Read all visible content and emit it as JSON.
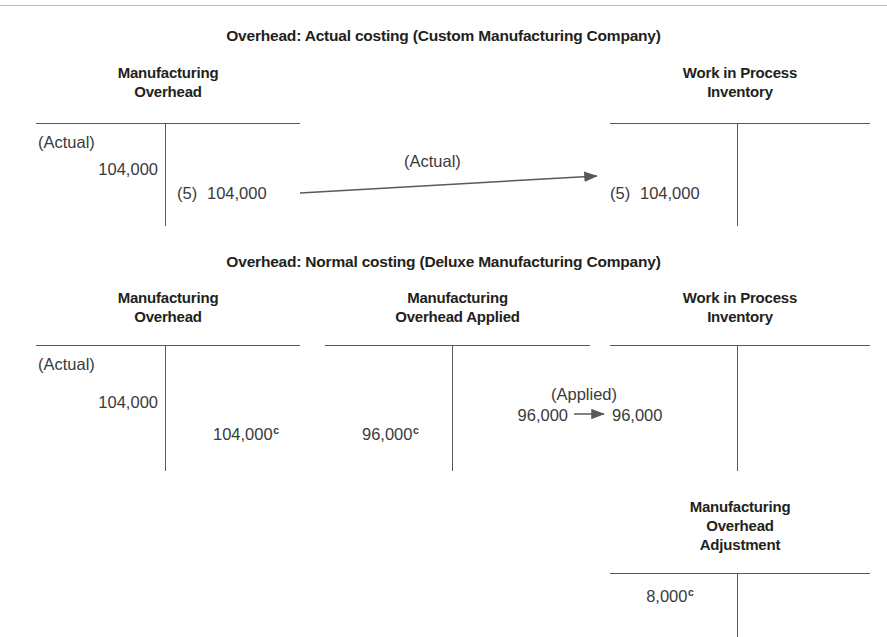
{
  "figure": {
    "note_marker": "c"
  },
  "sections": [
    {
      "title": "Overhead: Actual costing (Custom Manufacturing Company)",
      "accounts": [
        {
          "name": "Manufacturing Overhead",
          "line1": "Manufacturing",
          "line2": "Overhead",
          "debit_tag": "(Actual)",
          "debit_amount": "104,000",
          "credit_ref": "(5)",
          "credit_amount": "104,000"
        },
        {
          "name": "Work in Process Inventory",
          "line1": "Work in Process",
          "line2": "Inventory",
          "debit_ref": "(5)",
          "debit_amount": "104,000"
        }
      ],
      "flow": {
        "label": "(Actual)",
        "from_amount": "104,000",
        "to_amount": "104,000"
      }
    },
    {
      "title": "Overhead: Normal costing (Deluxe Manufacturing Company)",
      "accounts": [
        {
          "name": "Manufacturing Overhead",
          "line1": "Manufacturing",
          "line2": "Overhead",
          "debit_tag": "(Actual)",
          "debit_amount": "104,000",
          "credit_amount": "104,000",
          "credit_note": "c"
        },
        {
          "name": "Manufacturing Overhead Applied",
          "line1": "Manufacturing",
          "line2": "Overhead Applied",
          "debit_amount": "96,000",
          "debit_note": "c",
          "credit_tag": "(Applied)",
          "credit_amount": "96,000"
        },
        {
          "name": "Work in Process Inventory",
          "line1": "Work in Process",
          "line2": "Inventory",
          "debit_amount": "96,000"
        }
      ],
      "flow": {
        "label": "(Applied)",
        "from_amount": "96,000",
        "to_amount": "96,000"
      },
      "adjustment_account": {
        "name": "Manufacturing Overhead Adjustment",
        "line1": "Manufacturing",
        "line2": "Overhead",
        "line3": "Adjustment",
        "debit_amount": "8,000",
        "debit_note": "c"
      }
    }
  ]
}
